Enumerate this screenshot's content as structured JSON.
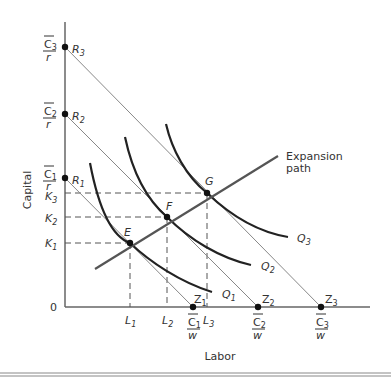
{
  "axes": {
    "y_label": "Capital",
    "x_label": "Labor",
    "origin": "0"
  },
  "budget_lines": [
    {
      "name": "R1",
      "r_label": "R",
      "r_sub": "1",
      "z_label": "Z",
      "z_sub": "1",
      "c": "C",
      "c_sub": "1",
      "denom_y": "r",
      "denom_x": "w"
    },
    {
      "name": "R2",
      "r_label": "R",
      "r_sub": "2",
      "z_label": "Z",
      "z_sub": "2",
      "c": "C",
      "c_sub": "2",
      "denom_y": "r",
      "denom_x": "w"
    },
    {
      "name": "R3",
      "r_label": "R",
      "r_sub": "3",
      "z_label": "Z",
      "z_sub": "3",
      "c": "C",
      "c_sub": "3",
      "denom_y": "r",
      "denom_x": "w"
    }
  ],
  "isoquants": [
    {
      "label": "Q",
      "sub": "1"
    },
    {
      "label": "Q",
      "sub": "2"
    },
    {
      "label": "Q",
      "sub": "3"
    }
  ],
  "points": [
    {
      "label": "E"
    },
    {
      "label": "F"
    },
    {
      "label": "G"
    }
  ],
  "k_ticks": [
    {
      "label": "K",
      "sub": "1"
    },
    {
      "label": "K",
      "sub": "2"
    },
    {
      "label": "K",
      "sub": "3"
    }
  ],
  "l_ticks": [
    {
      "label": "L",
      "sub": "1"
    },
    {
      "label": "L",
      "sub": "2"
    },
    {
      "label": "L",
      "sub": "3"
    }
  ],
  "expansion_path": {
    "line1": "Expansion",
    "line2": "path"
  },
  "colors": {
    "axis": "#666666",
    "budget": "#888888",
    "isoquant": "#222222",
    "expansion": "#555555",
    "dashed": "#555555"
  }
}
